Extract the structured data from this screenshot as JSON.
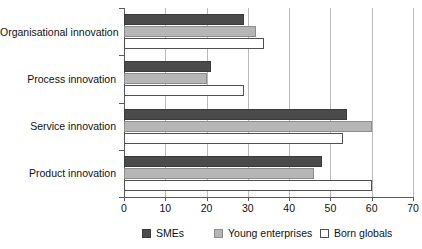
{
  "chart_data": {
    "type": "bar",
    "orientation": "horizontal",
    "title": "",
    "xlabel": "",
    "ylabel": "",
    "xlim": [
      0,
      70
    ],
    "xticks": [
      0,
      10,
      20,
      30,
      40,
      50,
      60,
      70
    ],
    "grid": "vertical",
    "legend_position": "bottom",
    "categories": [
      "Organisational innovation",
      "Process innovation",
      "Service innovation",
      "Product innovation"
    ],
    "series": [
      {
        "name": "SMEs",
        "color": "#4b4b4b",
        "values": [
          29,
          21,
          54,
          48
        ]
      },
      {
        "name": "Young enterprises",
        "color": "#b6b6b6",
        "values": [
          32,
          20,
          60,
          46
        ]
      },
      {
        "name": "Born globals",
        "color": "#ffffff",
        "values": [
          34,
          29,
          53,
          60
        ]
      }
    ]
  },
  "axis": {
    "tick_labels": [
      "0",
      "10",
      "20",
      "30",
      "40",
      "50",
      "60",
      "70"
    ]
  },
  "categories": {
    "0": "Organisational innovation",
    "1": "Process innovation",
    "2": "Service innovation",
    "3": "Product innovation"
  },
  "legend": {
    "items": [
      {
        "label": "SMEs"
      },
      {
        "label": "Young enterprises"
      },
      {
        "label": "Born globals"
      }
    ]
  }
}
